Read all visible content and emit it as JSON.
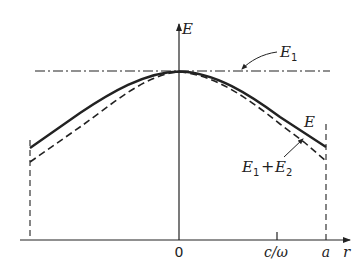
{
  "diagram": {
    "axes": {
      "y_label": "E",
      "x_label": "r",
      "x_ticks": [
        {
          "label": "0"
        },
        {
          "label": "c/ω"
        },
        {
          "label": "a"
        }
      ]
    },
    "curves": [
      {
        "name": "E1",
        "label_main": "E",
        "label_sub": "1",
        "style": "dash-dot",
        "description": "constant field level"
      },
      {
        "name": "E",
        "label_main": "E",
        "style": "solid",
        "description": "total field profile"
      },
      {
        "name": "E1+E2",
        "label_a_main": "E",
        "label_a_sub": "1",
        "plus": "+",
        "label_b_main": "E",
        "label_b_sub": "2",
        "style": "dashed",
        "description": "sum approximation"
      }
    ],
    "colors": {
      "ink": "#222222",
      "background": "#ffffff"
    }
  }
}
